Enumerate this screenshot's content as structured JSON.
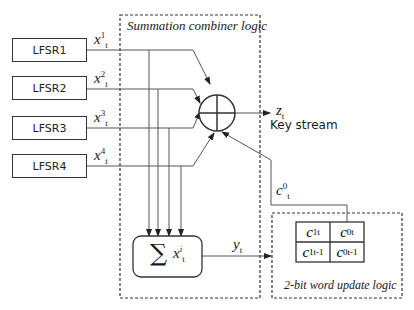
{
  "diagram": {
    "combiner_box": {
      "title": "Summation combiner logic"
    },
    "update_box": {
      "title": "2-bit word update logic"
    },
    "lfsrs": [
      {
        "label": "LFSR1",
        "output": {
          "base": "x",
          "sup": "1",
          "sub": "t"
        }
      },
      {
        "label": "LFSR2",
        "output": {
          "base": "x",
          "sup": "2",
          "sub": "t"
        }
      },
      {
        "label": "LFSR3",
        "output": {
          "base": "x",
          "sup": "3",
          "sub": "t"
        }
      },
      {
        "label": "LFSR4",
        "output": {
          "base": "x",
          "sup": "4",
          "sub": "t"
        }
      }
    ],
    "xor": {
      "symbol": "xor-circle"
    },
    "output": {
      "base": "z",
      "sub": "t",
      "caption": "Key stream"
    },
    "sum_block": {
      "symbol": "∑",
      "base": "x",
      "sup": "i",
      "sub": "t"
    },
    "sum_output": {
      "base": "y",
      "sub": "t"
    },
    "feedback": {
      "base": "c",
      "sup": "0",
      "sub": "t"
    },
    "carry_grid": [
      [
        {
          "base": "c",
          "sup": "1",
          "sub": "t"
        },
        {
          "base": "c",
          "sup": "0",
          "sub": "t"
        }
      ],
      [
        {
          "base": "c",
          "sup": "1",
          "sub": "t-1"
        },
        {
          "base": "c",
          "sup": "0",
          "sub": "t-1"
        }
      ]
    ]
  }
}
